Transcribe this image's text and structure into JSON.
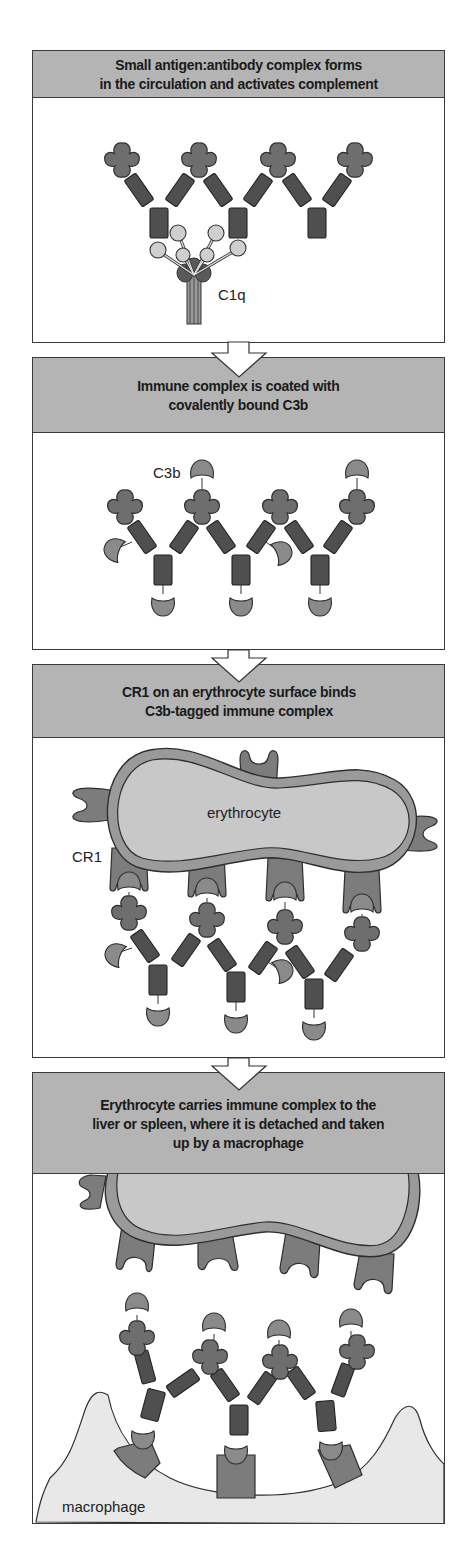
{
  "figure": {
    "panels": [
      {
        "step": 1,
        "title": "Small antigen:antibody complex forms\nin the circulation and activates complement",
        "labels": {
          "c1q": "C1q"
        }
      },
      {
        "step": 2,
        "title": "Immune complex is coated with\ncovalently bound C3b",
        "labels": {
          "c3b": "C3b"
        }
      },
      {
        "step": 3,
        "title": "CR1 on an erythrocyte surface binds\nC3b-tagged immune complex",
        "labels": {
          "erythrocyte": "erythrocyte",
          "cr1": "CR1"
        }
      },
      {
        "step": 4,
        "title": "Erythrocyte carries immune complex to the\nliver or spleen, where it is detached and taken\nup by a macrophage",
        "labels": {
          "macrophage": "macrophage"
        }
      }
    ],
    "colors": {
      "header_bg": "#b4b4b4",
      "antigen": "#6e6e6e",
      "antibody": "#4f4f4f",
      "c3b": "#8a8a8a",
      "c1q": "#cfcfcf",
      "erythrocyte_membrane": "#9a9a9a",
      "erythrocyte_fill": "#c8c8c8",
      "cr1": "#7c7c7c",
      "macrophage": "#e8e8e8"
    }
  }
}
